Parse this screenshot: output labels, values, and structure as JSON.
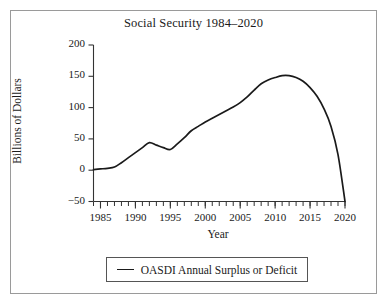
{
  "chart_data": {
    "type": "line",
    "title": "Social Security 1984–2020",
    "xlabel": "Year",
    "ylabel": "Billions of Dollars",
    "xlim": [
      1984,
      2020
    ],
    "ylim": [
      -50,
      200
    ],
    "grid": false,
    "legend_position": "below-axes",
    "xticks": [
      1985,
      1990,
      1995,
      2000,
      2005,
      2010,
      2015,
      2020
    ],
    "xtick_labels": [
      "1985",
      "1990",
      "1995",
      "2000",
      "2005",
      "2010",
      "2015",
      "2020"
    ],
    "minor_xtick_interval": 1,
    "yticks": [
      -50,
      0,
      50,
      100,
      150,
      200
    ],
    "ytick_labels": [
      "−50",
      "0",
      "50",
      "100",
      "150",
      "200"
    ],
    "series": [
      {
        "name": "OASDI Annual Surplus or Deficit",
        "color": "#1a1a1a",
        "x": [
          1984,
          1985,
          1986,
          1987,
          1988,
          1989,
          1990,
          1991,
          1992,
          1993,
          1994,
          1995,
          1996,
          1997,
          1998,
          1999,
          2000,
          2001,
          2002,
          2003,
          2004,
          2005,
          2006,
          2007,
          2008,
          2009,
          2010,
          2011,
          2012,
          2013,
          2014,
          2015,
          2016,
          2017,
          2018,
          2019,
          2020
        ],
        "values": [
          1,
          2,
          3,
          5,
          12,
          20,
          28,
          36,
          44,
          40,
          36,
          33,
          42,
          52,
          63,
          70,
          77,
          83,
          89,
          95,
          101,
          108,
          117,
          128,
          138,
          144,
          148,
          151,
          151,
          148,
          142,
          132,
          118,
          98,
          70,
          25,
          -50
        ]
      }
    ]
  },
  "legend": {
    "items": [
      {
        "label": "OASDI Annual Surplus or Deficit",
        "marker": "line-swatch"
      }
    ]
  }
}
